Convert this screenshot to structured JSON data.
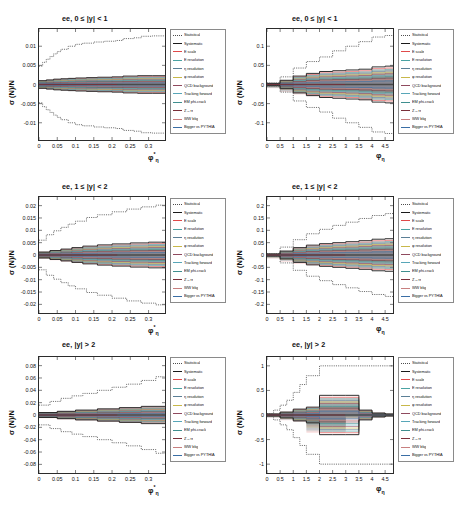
{
  "figure": {
    "kind": "systematic-uncertainty-breakdown",
    "channel": "ee",
    "rows": 3,
    "cols": 2
  },
  "legend": {
    "entries": [
      {
        "label": "Statistical",
        "color": "#4d4d4d",
        "dash": "dotted"
      },
      {
        "label": "Systematic",
        "color": "#1a1a1a",
        "dash": "solid"
      },
      {
        "label": "E scale",
        "color": "#e04a4a",
        "dash": "solid"
      },
      {
        "label": "E resolution",
        "color": "#4aa3a3",
        "dash": "solid"
      },
      {
        "label": "η resolution",
        "color": "#5b7f96",
        "dash": "solid"
      },
      {
        "label": "φ resolution",
        "color": "#c8b84a",
        "dash": "solid"
      },
      {
        "label": "QCD background",
        "color": "#8f4a5e",
        "dash": "solid"
      },
      {
        "label": "Tracking forward",
        "color": "#58a6b8",
        "dash": "solid"
      },
      {
        "label": "EM phi-crack",
        "color": "#3f8f8f",
        "dash": "solid"
      },
      {
        "label": "Z→ττ",
        "color": "#7a2f3a",
        "dash": "solid"
      },
      {
        "label": "WW bkg",
        "color": "#c87f7f",
        "dash": "solid"
      },
      {
        "label": "Bigger vs PYTHIA",
        "color": "#3a6ea5",
        "dash": "solid"
      }
    ]
  },
  "chart_data": [
    {
      "id": "panel-top-left",
      "type": "line",
      "title": "ee, 0 ≤ |y| < 1",
      "xlabel": "φ*η",
      "ylabel": "σ (N)/N",
      "xlim": [
        0,
        0.345
      ],
      "ylim": [
        -0.0145,
        0.0145
      ],
      "xticks": [
        0,
        0.05,
        0.1,
        0.15,
        0.2,
        0.25,
        0.3
      ],
      "xticklabels": [
        "0",
        "0.05",
        "0.1",
        "0.15",
        "0.2",
        "0.25",
        "0.3"
      ],
      "yticks": [
        -0.01,
        -0.005,
        0,
        0.005,
        0.01
      ],
      "yticklabels": [
        "-0.01",
        "-0.005",
        "0",
        "0.005",
        "0.01"
      ],
      "grid": false,
      "legend_position": "right-outside",
      "series": [
        {
          "name": "Statistical",
          "x": [
            0,
            0.01,
            0.02,
            0.03,
            0.04,
            0.05,
            0.06,
            0.08,
            0.1,
            0.12,
            0.15,
            0.18,
            0.21,
            0.23,
            0.26,
            0.28,
            0.31,
            0.345
          ],
          "upper": [
            0.0048,
            0.0058,
            0.0066,
            0.0073,
            0.008,
            0.0086,
            0.0092,
            0.01,
            0.0105,
            0.0108,
            0.0111,
            0.0113,
            0.0115,
            0.012,
            0.0122,
            0.0126,
            0.0127,
            0.0127
          ],
          "lower": [
            -0.0048,
            -0.0058,
            -0.0066,
            -0.0073,
            -0.008,
            -0.0086,
            -0.0092,
            -0.01,
            -0.0105,
            -0.0108,
            -0.0111,
            -0.0113,
            -0.0115,
            -0.012,
            -0.0122,
            -0.0126,
            -0.0127,
            -0.0127
          ]
        },
        {
          "name": "Systematic",
          "x": [
            0,
            0.02,
            0.04,
            0.06,
            0.08,
            0.1,
            0.13,
            0.16,
            0.2,
            0.23,
            0.27,
            0.31,
            0.345
          ],
          "upper": [
            0.001,
            0.0012,
            0.0014,
            0.0015,
            0.0016,
            0.0017,
            0.0018,
            0.0019,
            0.002,
            0.0022,
            0.0023,
            0.0023,
            0.0023
          ],
          "lower": [
            -0.001,
            -0.0012,
            -0.0014,
            -0.0015,
            -0.0016,
            -0.0017,
            -0.0018,
            -0.0019,
            -0.002,
            -0.0022,
            -0.0023,
            -0.0023,
            -0.0023
          ]
        }
      ]
    },
    {
      "id": "panel-top-right",
      "type": "line",
      "title": "ee, 0 ≤ |y| < 1",
      "xlabel": "φη",
      "ylabel": "σ (N)/N",
      "xlim": [
        0,
        4.8
      ],
      "ylim": [
        -0.145,
        0.145
      ],
      "xticks": [
        0,
        0.5,
        1,
        1.5,
        2,
        2.5,
        3,
        3.5,
        4,
        4.5
      ],
      "xticklabels": [
        "0",
        "0.5",
        "1",
        "1.5",
        "2",
        "2.5",
        "3",
        "3.5",
        "4",
        "4.5"
      ],
      "yticks": [
        -0.1,
        -0.05,
        0,
        0.05,
        0.1
      ],
      "yticklabels": [
        "-0.1",
        "-0.05",
        "0",
        "0.05",
        "0.1"
      ],
      "grid": false,
      "legend_position": "right-outside",
      "series": [
        {
          "name": "Statistical",
          "x": [
            0,
            0.5,
            1,
            1.5,
            2,
            2.5,
            3,
            3.5,
            4,
            4.5,
            4.8
          ],
          "upper": [
            0.004,
            0.02,
            0.043,
            0.06,
            0.072,
            0.088,
            0.1,
            0.112,
            0.124,
            0.128,
            0.128
          ],
          "lower": [
            -0.004,
            -0.02,
            -0.043,
            -0.06,
            -0.072,
            -0.088,
            -0.1,
            -0.112,
            -0.124,
            -0.128,
            -0.128
          ]
        },
        {
          "name": "Systematic",
          "x": [
            0,
            0.5,
            1,
            1.5,
            2,
            2.5,
            3,
            3.5,
            4,
            4.5,
            4.8
          ],
          "upper": [
            0.003,
            0.011,
            0.022,
            0.029,
            0.034,
            0.036,
            0.038,
            0.04,
            0.046,
            0.048,
            0.048
          ],
          "lower": [
            -0.003,
            -0.011,
            -0.022,
            -0.029,
            -0.034,
            -0.036,
            -0.038,
            -0.04,
            -0.046,
            -0.048,
            -0.048
          ]
        }
      ]
    },
    {
      "id": "panel-mid-left",
      "type": "line",
      "title": "ee, 1 ≤ |y| < 2",
      "xlabel": "φ*η",
      "ylabel": "σ (N)/N",
      "xlim": [
        0,
        0.345
      ],
      "ylim": [
        -0.0235,
        0.0235
      ],
      "xticks": [
        0,
        0.05,
        0.1,
        0.15,
        0.2,
        0.25,
        0.3
      ],
      "xticklabels": [
        "0",
        "0.05",
        "0.1",
        "0.15",
        "0.2",
        "0.25",
        "0.3"
      ],
      "yticks": [
        -0.02,
        -0.015,
        -0.01,
        -0.005,
        0,
        0.005,
        0.01,
        0.015,
        0.02
      ],
      "yticklabels": [
        "-0.02",
        "-0.015",
        "-0.01",
        "-0.005",
        "0",
        "0.005",
        "0.01",
        "0.015",
        "0.02"
      ],
      "grid": false,
      "legend_position": "right-outside",
      "series": [
        {
          "name": "Statistical",
          "x": [
            0,
            0.02,
            0.04,
            0.06,
            0.08,
            0.1,
            0.13,
            0.16,
            0.2,
            0.24,
            0.28,
            0.32,
            0.345
          ],
          "upper": [
            0.006,
            0.0082,
            0.0098,
            0.0112,
            0.0125,
            0.0137,
            0.0152,
            0.0163,
            0.0175,
            0.0186,
            0.0195,
            0.0202,
            0.0202
          ],
          "lower": [
            -0.006,
            -0.0082,
            -0.0098,
            -0.0112,
            -0.0125,
            -0.0137,
            -0.0152,
            -0.0163,
            -0.0175,
            -0.0186,
            -0.0195,
            -0.0202,
            -0.0202
          ]
        },
        {
          "name": "Systematic",
          "x": [
            0,
            0.03,
            0.06,
            0.09,
            0.12,
            0.16,
            0.2,
            0.25,
            0.3,
            0.345
          ],
          "upper": [
            0.0012,
            0.0018,
            0.0024,
            0.003,
            0.0036,
            0.0041,
            0.0045,
            0.0049,
            0.0052,
            0.0052
          ],
          "lower": [
            -0.0012,
            -0.0018,
            -0.0024,
            -0.003,
            -0.0036,
            -0.0041,
            -0.0045,
            -0.0049,
            -0.0052,
            -0.0052
          ]
        }
      ]
    },
    {
      "id": "panel-mid-right",
      "type": "line",
      "title": "ee, 1 ≤ |y| < 2",
      "xlabel": "φη",
      "ylabel": "σ (N)/N",
      "xlim": [
        0,
        4.8
      ],
      "ylim": [
        -0.235,
        0.235
      ],
      "xticks": [
        0,
        0.5,
        1,
        1.5,
        2,
        2.5,
        3,
        3.5,
        4,
        4.5
      ],
      "xticklabels": [
        "0",
        "0.5",
        "1",
        "1.5",
        "2",
        "2.5",
        "3",
        "3.5",
        "4",
        "4.5"
      ],
      "yticks": [
        -0.2,
        -0.15,
        -0.1,
        -0.05,
        0,
        0.05,
        0.1,
        0.15,
        0.2
      ],
      "yticklabels": [
        "-0.2",
        "-0.15",
        "-0.1",
        "-0.05",
        "0",
        "0.05",
        "0.1",
        "0.15",
        "0.2"
      ],
      "grid": false,
      "legend_position": "right-outside",
      "series": [
        {
          "name": "Statistical",
          "x": [
            0,
            0.5,
            1,
            1.5,
            2,
            2.5,
            3,
            3.5,
            4,
            4.5,
            4.8
          ],
          "upper": [
            0.006,
            0.032,
            0.062,
            0.086,
            0.104,
            0.12,
            0.133,
            0.148,
            0.16,
            0.168,
            0.168
          ],
          "lower": [
            -0.006,
            -0.032,
            -0.062,
            -0.086,
            -0.104,
            -0.12,
            -0.133,
            -0.148,
            -0.16,
            -0.168,
            -0.168
          ]
        },
        {
          "name": "Systematic",
          "x": [
            0,
            0.5,
            1,
            1.5,
            2,
            2.5,
            3,
            3.5,
            4,
            4.5,
            4.8
          ],
          "upper": [
            0.004,
            0.016,
            0.03,
            0.04,
            0.046,
            0.05,
            0.054,
            0.058,
            0.064,
            0.066,
            0.066
          ],
          "lower": [
            -0.004,
            -0.016,
            -0.03,
            -0.04,
            -0.046,
            -0.05,
            -0.054,
            -0.058,
            -0.064,
            -0.066,
            -0.066
          ]
        }
      ]
    },
    {
      "id": "panel-bot-left",
      "type": "line",
      "title": "ee, |y| > 2",
      "xlabel": "φ*η",
      "ylabel": "σ (N)/N",
      "xlim": [
        0,
        0.345
      ],
      "ylim": [
        -0.094,
        0.094
      ],
      "xticks": [
        0,
        0.05,
        0.1,
        0.15,
        0.2,
        0.25,
        0.3
      ],
      "xticklabels": [
        "0",
        "0.05",
        "0.1",
        "0.15",
        "0.2",
        "0.25",
        "0.3"
      ],
      "yticks": [
        -0.08,
        -0.06,
        -0.04,
        -0.02,
        0,
        0.02,
        0.04,
        0.06,
        0.08
      ],
      "yticklabels": [
        "-0.08",
        "-0.06",
        "-0.04",
        "-0.02",
        "0",
        "0.02",
        "0.04",
        "0.06",
        "0.08"
      ],
      "grid": false,
      "legend_position": "right-outside",
      "series": [
        {
          "name": "Statistical",
          "x": [
            0,
            0.03,
            0.06,
            0.09,
            0.12,
            0.16,
            0.2,
            0.24,
            0.28,
            0.32,
            0.345
          ],
          "upper": [
            0.016,
            0.022,
            0.027,
            0.031,
            0.035,
            0.04,
            0.045,
            0.05,
            0.056,
            0.062,
            0.062
          ],
          "lower": [
            -0.016,
            -0.022,
            -0.027,
            -0.031,
            -0.035,
            -0.04,
            -0.045,
            -0.05,
            -0.056,
            -0.062,
            -0.062
          ]
        },
        {
          "name": "Systematic",
          "x": [
            0,
            0.05,
            0.1,
            0.16,
            0.22,
            0.28,
            0.345
          ],
          "upper": [
            0.004,
            0.006,
            0.008,
            0.01,
            0.012,
            0.014,
            0.014
          ],
          "lower": [
            -0.004,
            -0.006,
            -0.008,
            -0.01,
            -0.012,
            -0.014,
            -0.014
          ]
        }
      ]
    },
    {
      "id": "panel-bot-right",
      "type": "line",
      "title": "ee, |y| > 2",
      "xlabel": "φη",
      "ylabel": "σ (N)/N",
      "xlim": [
        0,
        4.8
      ],
      "ylim": [
        -1.18,
        1.18
      ],
      "xticks": [
        0,
        0.5,
        1,
        1.5,
        2,
        2.5,
        3,
        3.5,
        4,
        4.5
      ],
      "xticklabels": [
        "0",
        "0.5",
        "1",
        "1.5",
        "2",
        "2.5",
        "3",
        "3.5",
        "4",
        "4.5"
      ],
      "yticks": [
        -1,
        -0.5,
        0,
        0.5,
        1
      ],
      "yticklabels": [
        "-1",
        "-0.5",
        "0",
        "0.5",
        "1"
      ],
      "grid": false,
      "legend_position": "right-outside",
      "series": [
        {
          "name": "Statistical",
          "x": [
            0,
            0.25,
            0.5,
            0.75,
            1,
            1.25,
            1.5,
            2,
            2.5,
            3,
            3.5,
            4,
            4.5,
            4.8
          ],
          "upper": [
            0.03,
            0.1,
            0.2,
            0.3,
            0.46,
            0.62,
            0.8,
            1.0,
            1.0,
            1.0,
            1.0,
            1.0,
            1.0,
            1.0
          ],
          "lower": [
            -0.03,
            -0.1,
            -0.2,
            -0.3,
            -0.46,
            -0.62,
            -0.8,
            -1.0,
            -1.0,
            -1.0,
            -1.0,
            -1.0,
            -1.0,
            -1.0
          ]
        },
        {
          "name": "Systematic",
          "x": [
            0,
            0.5,
            1,
            1.5,
            2,
            2.5,
            3,
            3.5,
            4,
            4.5,
            4.8
          ],
          "upper": [
            0.02,
            0.06,
            0.12,
            0.16,
            0.4,
            0.4,
            0.4,
            0.1,
            0.04,
            0.02,
            0.02
          ],
          "lower": [
            -0.02,
            -0.06,
            -0.12,
            -0.16,
            -0.4,
            -0.4,
            -0.4,
            -0.1,
            -0.04,
            -0.02,
            -0.02
          ]
        }
      ]
    }
  ]
}
